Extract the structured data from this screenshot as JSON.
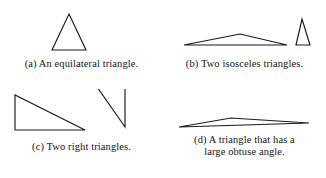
{
  "figure": {
    "background_color": "#ffffff",
    "stroke_color": "#1a1a1a"
  },
  "panels": [
    {
      "id": "a",
      "label": "(a)",
      "caption": "(a) An equilateral triangle.",
      "shape_name": "equilateral-triangle",
      "count": 1
    },
    {
      "id": "b",
      "label": "(b)",
      "caption": "(b) Two isosceles triangles.",
      "shape_name": "isosceles-triangles",
      "count": 2
    },
    {
      "id": "c",
      "label": "(c)",
      "caption": "(c) Two right triangles.",
      "shape_name": "right-triangles",
      "count": 2
    },
    {
      "id": "d",
      "label": "(d)",
      "caption_line1": "(d) A triangle that has a",
      "caption_line2": "large obtuse angle.",
      "shape_name": "obtuse-triangle",
      "count": 1
    }
  ]
}
